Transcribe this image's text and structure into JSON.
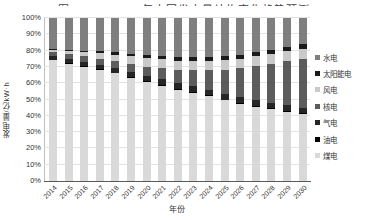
{
  "chart": {
    "title": "图 2014—2030年中国发电量结构变化趋势预测",
    "y_axis_title": "发电量/亿kW·h",
    "x_axis_title": "年份"
  },
  "chart_data": {
    "type": "bar",
    "stacked": true,
    "percent_stacked": true,
    "title": "图 2014—2030年中国发电量结构变化趋势预测",
    "xlabel": "年份",
    "ylabel": "发电量/亿kW·h",
    "ylim": [
      0,
      100
    ],
    "grid": true,
    "legend_position": "right",
    "y_ticks_top_to_bottom": [
      "100%",
      "90%",
      "80%",
      "70%",
      "60%",
      "50%",
      "40%",
      "30%",
      "20%",
      "10%",
      "0%"
    ],
    "categories": [
      "2014",
      "2015",
      "2016",
      "2017",
      "2018",
      "2019",
      "2020",
      "2021",
      "2022",
      "2023",
      "2024",
      "2025",
      "2026",
      "2027",
      "2028",
      "2029",
      "2030"
    ],
    "series": [
      {
        "name": "水电",
        "color": "#7f7f7f",
        "values": [
          19.0,
          19.5,
          20.0,
          20.5,
          21.0,
          21.8,
          22.8,
          23.3,
          23.9,
          24.0,
          23.8,
          23.4,
          22.4,
          20.8,
          19.3,
          17.7,
          16.2
        ]
      },
      {
        "name": "太阳能电",
        "color": "#1a1a1a",
        "values": [
          0.5,
          0.8,
          1.0,
          1.2,
          1.4,
          1.7,
          2.0,
          2.1,
          2.2,
          2.3,
          2.4,
          2.5,
          2.5,
          2.5,
          2.5,
          2.5,
          2.5
        ]
      },
      {
        "name": "风电",
        "color": "#c9c9c9",
        "values": [
          1.5,
          2.0,
          2.6,
          3.2,
          3.8,
          4.5,
          5.0,
          5.3,
          5.5,
          5.7,
          5.8,
          6.0,
          6.0,
          6.1,
          6.1,
          6.2,
          6.2
        ]
      },
      {
        "name": "核电",
        "color": "#5c5c5c",
        "values": [
          2.5,
          3.0,
          3.5,
          4.0,
          4.5,
          5.0,
          5.5,
          7.0,
          8.5,
          10.0,
          12.0,
          14.5,
          17.5,
          21.0,
          24.0,
          27.0,
          30.0
        ]
      },
      {
        "name": "气电",
        "color": "#262626",
        "values": [
          2.0,
          2.2,
          2.4,
          2.6,
          2.8,
          3.0,
          3.2,
          3.3,
          3.4,
          3.5,
          3.5,
          3.6,
          3.6,
          3.6,
          3.6,
          3.6,
          3.6
        ]
      },
      {
        "name": "油电",
        "color": "#000000",
        "values": [
          0.5,
          0.5,
          0.5,
          0.5,
          0.5,
          0.5,
          0.5,
          0.5,
          0.5,
          0.5,
          0.5,
          0.5,
          0.5,
          0.5,
          0.5,
          0.5,
          0.5
        ]
      },
      {
        "name": "煤电",
        "color": "#d9d9d9",
        "values": [
          74.0,
          72.0,
          70.0,
          68.0,
          66.0,
          63.5,
          61.0,
          58.5,
          56.0,
          54.0,
          52.0,
          49.5,
          47.5,
          45.5,
          44.0,
          42.5,
          41.0
        ]
      }
    ]
  }
}
